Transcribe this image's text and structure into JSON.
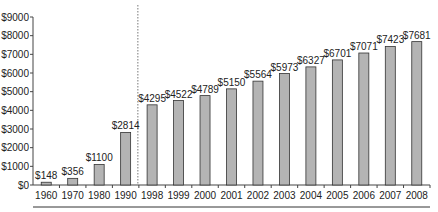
{
  "chart_data": {
    "type": "bar",
    "title": "",
    "xlabel": "",
    "ylabel": "",
    "categories": [
      "1960",
      "1970",
      "1980",
      "1990",
      "1998",
      "1999",
      "2000",
      "2001",
      "2002",
      "2003",
      "2004",
      "2005",
      "2006",
      "2007",
      "2008"
    ],
    "values": [
      148,
      356,
      1100,
      2814,
      4295,
      4522,
      4789,
      5150,
      5564,
      5973,
      6327,
      6701,
      7071,
      7423,
      7681
    ],
    "data_labels": [
      "$148",
      "$356",
      "$1100",
      "$2814",
      "$4295",
      "$4522",
      "$4789",
      "$5150",
      "$5564",
      "$5973",
      "$6327",
      "$6701",
      "$7071",
      "$7423",
      "$7681"
    ],
    "ylim": [
      0,
      9000
    ],
    "yticks": [
      0,
      1000,
      2000,
      3000,
      4000,
      5000,
      6000,
      7000,
      8000,
      9000
    ],
    "ytick_labels": [
      "$0",
      "$1000",
      "$2000",
      "$3000",
      "$4000",
      "$5000",
      "$6000",
      "$7000",
      "$8000",
      "$9000"
    ],
    "grid": false,
    "legend": null,
    "annotations": [
      {
        "type": "dotted-vertical-line",
        "between": [
          "1990",
          "1998"
        ]
      }
    ],
    "colors": {
      "bar_fill": "#b4b4b4",
      "bar_stroke": "#333333",
      "axis": "#444444",
      "dotted_line": "#777777"
    }
  }
}
